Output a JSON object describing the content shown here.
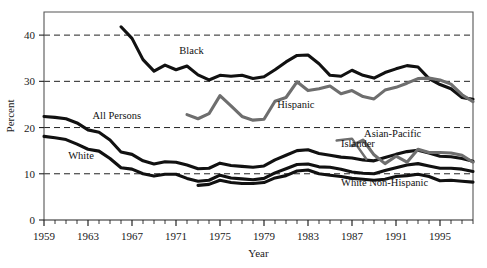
{
  "chart_data": {
    "type": "line",
    "title": "",
    "subtitle": "",
    "xlabel": "Year",
    "ylabel": "Percent",
    "xlim": [
      1959,
      1998
    ],
    "ylim": [
      0,
      45
    ],
    "yticks": [
      0,
      10,
      20,
      30,
      40
    ],
    "ytick_labels": [
      "0",
      "10",
      "20",
      "30",
      "40"
    ],
    "xticks": [
      1959,
      1963,
      1967,
      1971,
      1975,
      1979,
      1983,
      1987,
      1991,
      1995
    ],
    "xtick_labels": [
      "1959",
      "1963",
      "1967",
      "1971",
      "1975",
      "1979",
      "1983",
      "1987",
      "1991",
      "1995"
    ],
    "minor_xticks_every": 1,
    "grid": "horizontal-dashed",
    "gridlines_at": [
      10,
      20,
      30,
      40
    ],
    "legend": "inline-labels",
    "colors": {
      "dark": "#111111",
      "gray": "#6e6e6e",
      "frame": "#555555",
      "grid": "#222222"
    },
    "series": [
      {
        "name": "Black",
        "color": "#111111",
        "label": "Black",
        "label_x": 1971.3,
        "label_y": 36.0,
        "x": [
          1966,
          1967,
          1968,
          1969,
          1970,
          1971,
          1972,
          1973,
          1974,
          1975,
          1976,
          1977,
          1978,
          1979,
          1980,
          1981,
          1982,
          1983,
          1984,
          1985,
          1986,
          1987,
          1988,
          1989,
          1990,
          1991,
          1992,
          1993,
          1994,
          1995,
          1996,
          1997,
          1998
        ],
        "values": [
          41.8,
          39.3,
          34.7,
          32.2,
          33.5,
          32.5,
          33.3,
          31.4,
          30.3,
          31.3,
          31.1,
          31.3,
          30.6,
          31.0,
          32.5,
          34.2,
          35.6,
          35.7,
          33.8,
          31.3,
          31.1,
          32.4,
          31.3,
          30.7,
          31.9,
          32.7,
          33.4,
          33.1,
          30.6,
          29.3,
          28.4,
          26.5,
          26.1
        ]
      },
      {
        "name": "All Persons",
        "color": "#111111",
        "label": "All Persons",
        "label_x": 1963.4,
        "label_y": 21.8,
        "x": [
          1959,
          1960,
          1961,
          1962,
          1963,
          1964,
          1965,
          1966,
          1967,
          1968,
          1969,
          1970,
          1971,
          1972,
          1973,
          1974,
          1975,
          1976,
          1977,
          1978,
          1979,
          1980,
          1981,
          1982,
          1983,
          1984,
          1985,
          1986,
          1987,
          1988,
          1989,
          1990,
          1991,
          1992,
          1993,
          1994,
          1995,
          1996,
          1997,
          1998
        ],
        "values": [
          22.4,
          22.2,
          21.9,
          21.0,
          19.5,
          19.0,
          17.3,
          14.7,
          14.2,
          12.8,
          12.1,
          12.6,
          12.5,
          11.9,
          11.1,
          11.2,
          12.3,
          11.8,
          11.6,
          11.4,
          11.7,
          13.0,
          14.0,
          15.0,
          15.2,
          14.4,
          14.0,
          13.6,
          13.4,
          13.0,
          12.8,
          13.5,
          14.2,
          14.8,
          15.1,
          14.5,
          13.8,
          13.7,
          13.3,
          12.7
        ]
      },
      {
        "name": "White",
        "color": "#111111",
        "label": "White",
        "label_x": 1961.2,
        "label_y": 13.2,
        "x": [
          1959,
          1960,
          1961,
          1962,
          1963,
          1964,
          1965,
          1966,
          1967,
          1968,
          1969,
          1970,
          1971,
          1972,
          1973,
          1974,
          1975,
          1976,
          1977,
          1978,
          1979,
          1980,
          1981,
          1982,
          1983,
          1984,
          1985,
          1986,
          1987,
          1988,
          1989,
          1990,
          1991,
          1992,
          1993,
          1994,
          1995,
          1996,
          1997,
          1998
        ],
        "values": [
          18.1,
          17.8,
          17.4,
          16.4,
          15.3,
          14.9,
          13.3,
          11.3,
          11.0,
          10.0,
          9.5,
          9.9,
          9.9,
          9.0,
          8.4,
          8.6,
          9.7,
          9.1,
          8.9,
          8.7,
          9.0,
          10.2,
          11.1,
          12.0,
          12.1,
          11.5,
          11.4,
          11.0,
          10.4,
          10.1,
          10.0,
          10.7,
          11.3,
          11.9,
          12.2,
          11.7,
          11.2,
          11.2,
          11.0,
          10.5
        ]
      },
      {
        "name": "Hispanic",
        "color": "#6e6e6e",
        "label": "Hispanic",
        "label_x": 1980.2,
        "label_y": 24.2,
        "x": [
          1972,
          1973,
          1974,
          1975,
          1976,
          1977,
          1978,
          1979,
          1980,
          1981,
          1982,
          1983,
          1984,
          1985,
          1986,
          1987,
          1988,
          1989,
          1990,
          1991,
          1992,
          1993,
          1994,
          1995,
          1996,
          1997,
          1998
        ],
        "values": [
          22.8,
          21.9,
          23.0,
          26.9,
          24.7,
          22.4,
          21.6,
          21.8,
          25.7,
          26.5,
          29.9,
          28.0,
          28.4,
          29.0,
          27.3,
          28.0,
          26.7,
          26.2,
          28.1,
          28.7,
          29.6,
          30.6,
          30.7,
          30.3,
          29.4,
          27.1,
          25.6
        ]
      },
      {
        "name": "Asian-Pacific Islander",
        "color": "#6e6e6e",
        "label": "Asian-Pacific",
        "label2": "Islander",
        "label_x": 1988.1,
        "label_y": 17.9,
        "label2_x": 1986.0,
        "label2_y": 15.9,
        "x": [
          1987,
          1988,
          1989,
          1990,
          1991,
          1992,
          1993,
          1994,
          1995,
          1996,
          1997,
          1998
        ],
        "values": [
          16.1,
          17.3,
          14.1,
          12.2,
          13.8,
          12.5,
          15.3,
          14.6,
          14.6,
          14.5,
          14.0,
          12.5
        ]
      },
      {
        "name": "White Non-Hispanic",
        "color": "#111111",
        "label": "White Non-Hispanic",
        "label_x": 1986.0,
        "label_y": 7.4,
        "x": [
          1973,
          1974,
          1975,
          1976,
          1977,
          1978,
          1979,
          1980,
          1981,
          1982,
          1983,
          1984,
          1985,
          1986,
          1987,
          1988,
          1989,
          1990,
          1991,
          1992,
          1993,
          1994,
          1995,
          1996,
          1997,
          1998
        ],
        "values": [
          7.5,
          7.7,
          8.6,
          8.1,
          7.9,
          7.9,
          8.1,
          9.1,
          9.6,
          10.6,
          10.8,
          10.0,
          9.7,
          9.4,
          9.0,
          8.8,
          8.6,
          8.8,
          9.4,
          9.6,
          9.9,
          9.4,
          8.5,
          8.6,
          8.4,
          8.2
        ]
      }
    ]
  }
}
